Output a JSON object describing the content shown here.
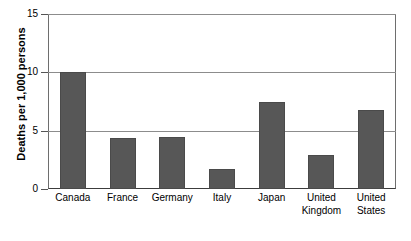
{
  "chart_data": {
    "type": "bar",
    "title": "",
    "subtitle": "",
    "xlabel": "",
    "ylabel": "Deaths per 1,000 persons",
    "categories": [
      "Canada",
      "France",
      "Germany",
      "Italy",
      "Japan",
      "United Kingdom",
      "United States"
    ],
    "category_lines": [
      [
        "Canada"
      ],
      [
        "France"
      ],
      [
        "Germany"
      ],
      [
        "Italy"
      ],
      [
        "Japan"
      ],
      [
        "United",
        "Kingdom"
      ],
      [
        "United",
        "States"
      ]
    ],
    "values": [
      10.0,
      4.4,
      4.5,
      1.7,
      7.5,
      2.9,
      6.8
    ],
    "ylim": [
      0,
      15
    ],
    "yticks": [
      0,
      5,
      10,
      15
    ],
    "ytick_labels": [
      "0",
      "5",
      "10",
      "15"
    ],
    "grid": "horizontal",
    "legend": "none",
    "bar_color": "#575757",
    "grid_color": "#8c8c8c",
    "axis_color": "#3c3c3c",
    "background": "#ffffff"
  }
}
